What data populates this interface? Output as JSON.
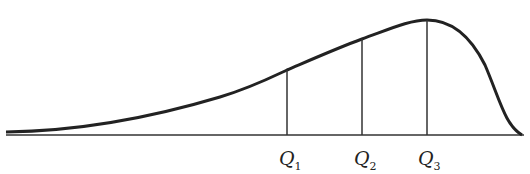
{
  "diagram": {
    "labels": [
      {
        "id": "q1",
        "letter": "Q",
        "sub": "1",
        "x": 287
      },
      {
        "id": "q2",
        "letter": "Q",
        "sub": "2",
        "x": 362
      },
      {
        "id": "q3",
        "letter": "Q",
        "sub": "3",
        "x": 427
      }
    ],
    "colors": {
      "stroke": "#222222",
      "background": "#ffffff"
    }
  }
}
